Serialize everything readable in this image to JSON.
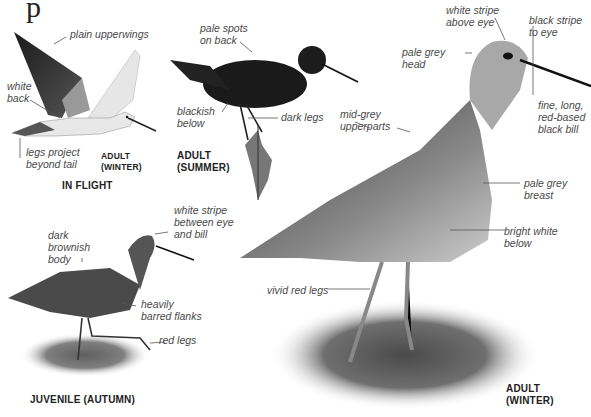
{
  "page": {
    "title_fragment": "p"
  },
  "figures": {
    "in_flight": {
      "caption": "IN FLIGHT",
      "sub_caption": "ADULT\n(WINTER)",
      "labels": [
        "plain upperwings",
        "white\nback",
        "legs project\nbeyond tail"
      ]
    },
    "adult_summer": {
      "caption": "ADULT\n(SUMMER)",
      "labels": [
        "pale spots\non back",
        "blackish\nbelow",
        "dark legs"
      ]
    },
    "juvenile_autumn": {
      "caption": "JUVENILE (AUTUMN)",
      "labels": [
        "dark\nbrownish\nbody",
        "white stripe\nbetween eye\nand bill",
        "heavily\nbarred flanks",
        "red legs"
      ]
    },
    "adult_winter": {
      "caption": "ADULT\n(WINTER)",
      "labels": [
        "white stripe\nabove eye",
        "black stripe\nto eye",
        "pale grey\nhead",
        "fine, long,\nred-based\nblack bill",
        "mid-grey\nupperparts",
        "pale grey\nbreast",
        "bright white\nbelow",
        "vivid red legs"
      ]
    }
  },
  "colors": {
    "label_text": "#4a4a4a",
    "caption_text": "#222222",
    "bird_dark": "#1c1c1c",
    "bird_mid": "#7a7a7a",
    "bird_light": "#d9d9d9"
  }
}
